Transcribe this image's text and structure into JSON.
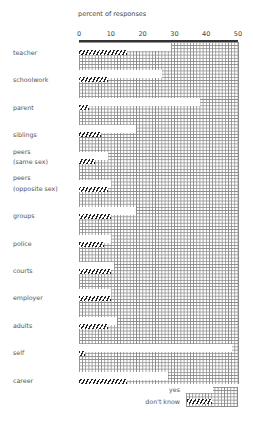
{
  "chart_data": {
    "type": "bar",
    "title": "percent of responses",
    "xlabel": "percent of responses",
    "ylabel": "",
    "xlim": [
      0,
      50
    ],
    "ticks": [
      "0",
      "10",
      "20",
      "30",
      "40",
      "50"
    ],
    "grid": true,
    "orientation": "horizontal",
    "legend_position": "bottom-right",
    "categories": [
      "teacher",
      "schoolwork",
      "parent",
      "siblings",
      "peers (same sex)",
      "peers (opposite sex)",
      "groups",
      "police",
      "courts",
      "employer",
      "adults",
      "self",
      "career"
    ],
    "series": [
      {
        "name": "yes",
        "values": [
          29,
          26,
          38,
          18,
          9,
          10,
          18,
          10,
          11,
          10,
          12,
          48,
          28
        ]
      },
      {
        "name": "don't know",
        "values": [
          15,
          9,
          3,
          7,
          5,
          9,
          10,
          8,
          10,
          10,
          9,
          2,
          15
        ]
      }
    ]
  },
  "labels": {
    "title": "percent of responses",
    "legend_yes": "yes",
    "legend_dont_know": "don't know"
  },
  "rows": [
    {
      "label1": "teacher",
      "label2": ""
    },
    {
      "label1": "schoolwork",
      "label2": ""
    },
    {
      "label1": "parent",
      "label2": ""
    },
    {
      "label1": "siblings",
      "label2": ""
    },
    {
      "label1": "peers",
      "label2": "(same sex)"
    },
    {
      "label1": "peers",
      "label2": "(opposite sex)"
    },
    {
      "label1": "groups",
      "label2": ""
    },
    {
      "label1": "police",
      "label2": ""
    },
    {
      "label1": "courts",
      "label2": ""
    },
    {
      "label1": "employer",
      "label2": ""
    },
    {
      "label1": "adults",
      "label2": ""
    },
    {
      "label1": "self",
      "label2": ""
    },
    {
      "label1": "career",
      "label2": ""
    }
  ]
}
